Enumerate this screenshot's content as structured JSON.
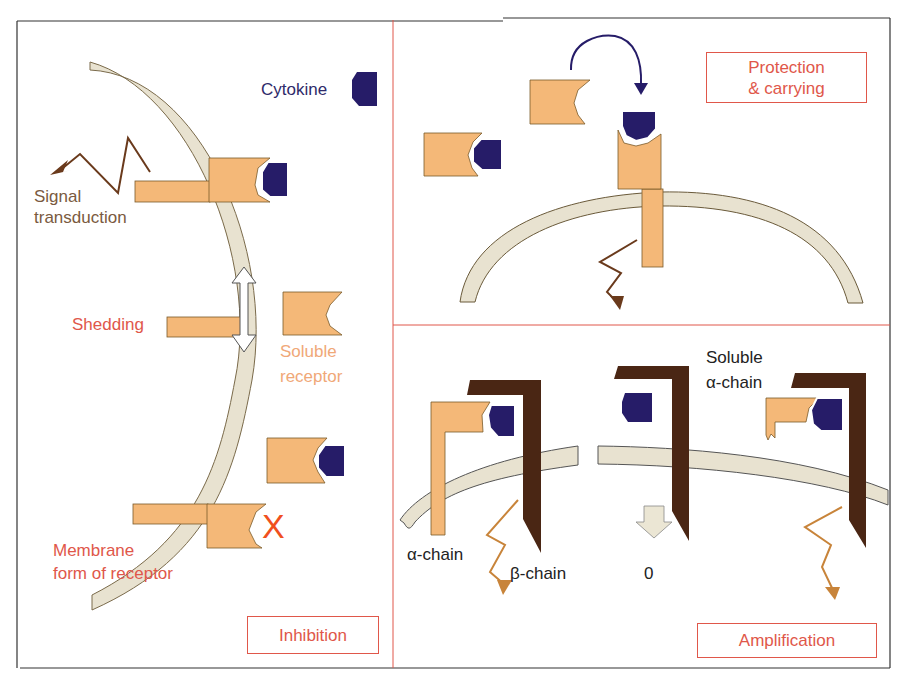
{
  "colors": {
    "receptor": "#f4b878",
    "cytokine": "#261c68",
    "membrane": "#e8e2d0",
    "beta_chain": "#4a2614",
    "signal_arrow_brown": "#6a3a1c",
    "signal_arrow_orange": "#c8843a",
    "label_red": "#e0574a",
    "label_orange": "#f0a878",
    "label_navy": "#2e2a6a",
    "label_brown": "#7a5a40",
    "frame": "#333333",
    "divider": "#e0574a"
  },
  "panels": {
    "inhibition": {
      "title": "Inhibition",
      "labels": {
        "cytokine": "Cytokine",
        "signal_1": "Signal",
        "signal_2": "transduction",
        "shedding": "Shedding",
        "soluble_1": "Soluble",
        "soluble_2": "receptor",
        "membrane_1": "Membrane",
        "membrane_2": "form of receptor",
        "blocked_mark": "X"
      }
    },
    "protection": {
      "title_1": "Protection",
      "title_2": "& carrying"
    },
    "amplification": {
      "title": "Amplification",
      "labels": {
        "alpha_chain": "α-chain",
        "beta_chain": "β-chain",
        "zero": "0",
        "soluble_1": "Soluble",
        "soluble_2": "α-chain"
      }
    }
  }
}
